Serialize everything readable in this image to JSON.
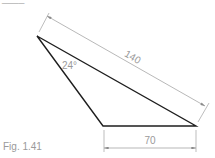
{
  "figure": {
    "caption": "Fig. 1.41",
    "top_cut_text": "____",
    "colors": {
      "shape": "#1e1e1e",
      "dimension": "#9a9a9a",
      "text": "#9a9a9a"
    },
    "triangle": {
      "vertices": {
        "apex": [
          37,
          36
        ],
        "bottom_left": [
          103,
          126
        ],
        "bottom_right": [
          196,
          126
        ]
      }
    },
    "dimensions": [
      {
        "id": "slant",
        "label": "140",
        "from": "apex",
        "to": "bottom_right"
      },
      {
        "id": "base",
        "label": "70",
        "from": "bottom_left",
        "to": "bottom_right"
      }
    ],
    "angle": {
      "label": "24°",
      "at": "apex"
    }
  }
}
